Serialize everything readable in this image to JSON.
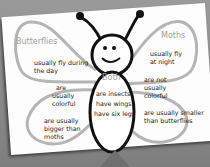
{
  "diagram": {
    "left": {
      "title": "Butterflies",
      "facts": [
        "usually fly during",
        "the day",
        "are",
        "usually",
        "colorful",
        "are usually",
        "bigger than",
        "moths"
      ]
    },
    "right": {
      "title": "Moths",
      "facts": [
        "usually fly",
        "at night",
        "are not",
        "usually",
        "colorful",
        "are usually smaller",
        "than butterflies"
      ]
    },
    "center": {
      "title": "Both",
      "facts": [
        "are insects",
        "have wings",
        "have six legs"
      ]
    },
    "colors": {
      "wing_outline": "#b5b5b5",
      "body_outline": "#111111",
      "paper": "#fdfdfd",
      "background": "#8a8a8a",
      "heading": "#a0a0a0"
    }
  }
}
